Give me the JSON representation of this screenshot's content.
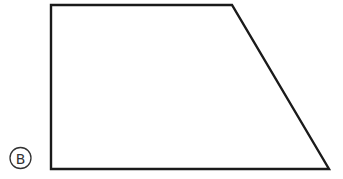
{
  "figure": {
    "type": "quadrilateral",
    "shape_name": "trapezoid",
    "stroke_color": "#1a1a1a",
    "vertices": [
      {
        "x": 51,
        "y": 5
      },
      {
        "x": 232,
        "y": 5
      },
      {
        "x": 329,
        "y": 169
      },
      {
        "x": 51,
        "y": 169
      }
    ]
  },
  "label": {
    "text": "B",
    "style": "circled",
    "center": {
      "x": 20.5,
      "y": 158
    },
    "radius": 10.5,
    "color": "#333333"
  }
}
